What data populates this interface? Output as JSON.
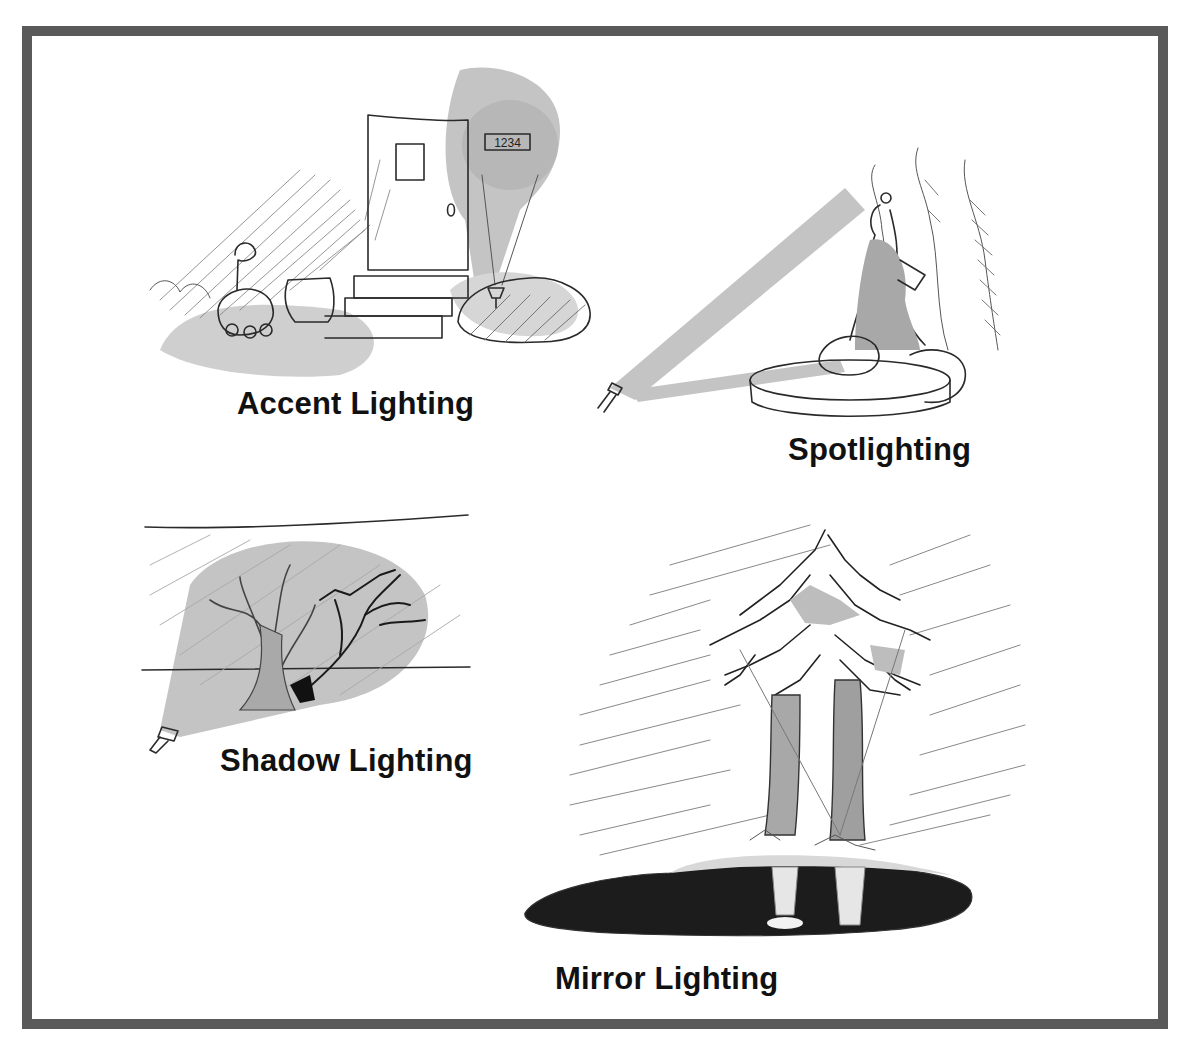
{
  "figure": {
    "frame_color": "#5a5a5a",
    "light_wash_color": "#c4c4c4",
    "ink_color": "#2a2a2a"
  },
  "panels": [
    {
      "id": "accent",
      "caption": "Accent Lighting",
      "sketch": "front door with steps, planters and a house-number sign lit by a small ground fixture",
      "house_number": "1234"
    },
    {
      "id": "spot",
      "caption": "Spotlighting",
      "sketch": "ground spotlight casting a beam onto a statue on a fountain basin with cypress trees behind"
    },
    {
      "id": "shadow",
      "caption": "Shadow Lighting",
      "sketch": "ground light projecting a tree's shadow onto a wall"
    },
    {
      "id": "mirror",
      "caption": "Mirror Lighting",
      "sketch": "lit pine trees reflected in a dark pond"
    }
  ]
}
